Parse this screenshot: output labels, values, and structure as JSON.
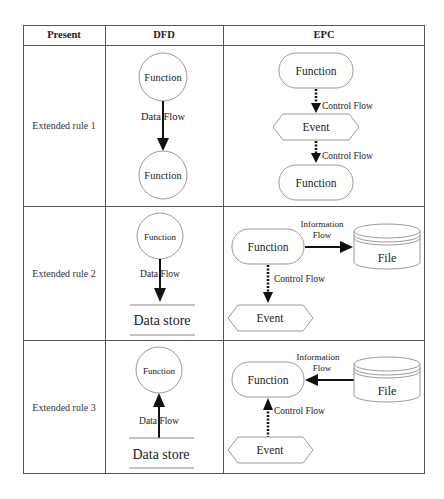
{
  "header": {
    "col1": "Present",
    "col2": "DFD",
    "col3": "EPC"
  },
  "rows": [
    {
      "label": "Extended rule 1",
      "dfd": {
        "source": "Function",
        "flow": "Data Flow",
        "target": "Function"
      },
      "epc": {
        "top": "Function",
        "flow1": "Control Flow",
        "event": "Event",
        "flow2": "Control Flow",
        "bottom": "Function"
      }
    },
    {
      "label": "Extended rule 2",
      "dfd": {
        "source": "Function",
        "flow": "Data Flow",
        "target": "Data store"
      },
      "epc": {
        "function": "Function",
        "info_flow_line1": "Information",
        "info_flow_line2": "Flow",
        "file": "File",
        "control_flow": "Control Flow",
        "event": "Event"
      }
    },
    {
      "label": "Extended rule 3",
      "dfd": {
        "target": "Function",
        "flow": "Data Flow",
        "source": "Data store"
      },
      "epc": {
        "function": "Function",
        "info_flow_line1": "Information",
        "info_flow_line2": "Flow",
        "file": "File",
        "control_flow": "Control Flow",
        "event": "Event"
      }
    }
  ],
  "colors": {
    "border": "#555555",
    "shape_stroke": "#888888",
    "arrow": "#111111",
    "text": "#222222"
  }
}
